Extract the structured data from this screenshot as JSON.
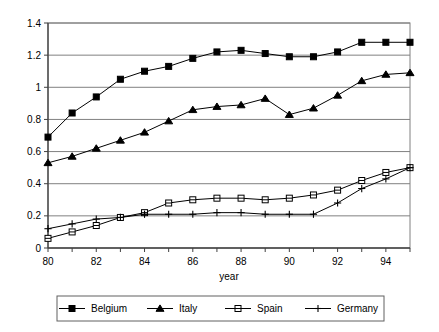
{
  "chart_data": {
    "type": "line",
    "title": "",
    "xlabel": "year",
    "ylabel": "",
    "xlim": [
      80,
      95
    ],
    "ylim": [
      0,
      1.4
    ],
    "grid": true,
    "grid_axis": "y",
    "legend_position": "bottom",
    "x": [
      80,
      81,
      82,
      83,
      84,
      85,
      86,
      87,
      88,
      89,
      90,
      91,
      92,
      93,
      94,
      95
    ],
    "xtick_labels": [
      "80",
      "82",
      "84",
      "86",
      "88",
      "90",
      "92",
      "94"
    ],
    "xtick_values": [
      80,
      82,
      84,
      86,
      88,
      90,
      92,
      94
    ],
    "ytick_labels": [
      "0",
      "0.2",
      "0.4",
      "0.6",
      "0.8",
      "1",
      "1.2",
      "1.4"
    ],
    "ytick_values": [
      0,
      0.2,
      0.4,
      0.6,
      0.8,
      1.0,
      1.2,
      1.4
    ],
    "series": [
      {
        "name": "Belgium",
        "marker": "filled-square",
        "color": "#000000",
        "values": [
          0.69,
          0.84,
          0.94,
          1.05,
          1.1,
          1.13,
          1.18,
          1.22,
          1.23,
          1.21,
          1.19,
          1.19,
          1.22,
          1.28,
          1.28,
          1.28
        ]
      },
      {
        "name": "Italy",
        "marker": "filled-triangle",
        "color": "#000000",
        "values": [
          0.53,
          0.57,
          0.62,
          0.67,
          0.72,
          0.79,
          0.86,
          0.88,
          0.89,
          0.93,
          0.83,
          0.87,
          0.95,
          1.04,
          1.08,
          1.09
        ]
      },
      {
        "name": "Spain",
        "marker": "open-square",
        "color": "#000000",
        "values": [
          0.06,
          0.1,
          0.14,
          0.19,
          0.22,
          0.28,
          0.3,
          0.31,
          0.31,
          0.3,
          0.31,
          0.33,
          0.36,
          0.42,
          0.47,
          0.5
        ]
      },
      {
        "name": "Germany",
        "marker": "plus",
        "color": "#000000",
        "values": [
          0.12,
          0.15,
          0.18,
          0.19,
          0.21,
          0.21,
          0.21,
          0.22,
          0.22,
          0.21,
          0.21,
          0.21,
          0.28,
          0.37,
          0.43,
          0.5
        ]
      }
    ]
  },
  "axes": {
    "x_title": "year"
  },
  "legend": {
    "entries": [
      {
        "label": "Belgium",
        "marker": "filled-square"
      },
      {
        "label": "Italy",
        "marker": "filled-triangle"
      },
      {
        "label": "Spain",
        "marker": "open-square"
      },
      {
        "label": "Germany",
        "marker": "plus"
      }
    ]
  }
}
